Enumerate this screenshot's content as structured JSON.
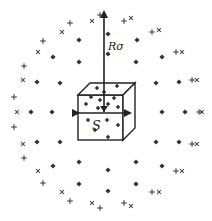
{
  "labels": {
    "radius": "Rσ",
    "side": "S"
  },
  "colors": {
    "ink": "#222222",
    "marker": "#333333",
    "background": "#ffffff"
  },
  "center": [
    106,
    112
  ],
  "cube": {
    "front_x": 78,
    "front_y": 95,
    "size": 45,
    "depth": 12
  },
  "arrow_up": {
    "from": [
      104,
      112
    ],
    "to": [
      104,
      12
    ]
  },
  "arrow_horiz": {
    "from": [
      78,
      113
    ],
    "to": [
      130,
      113
    ]
  },
  "dots": [
    [
      108,
      34
    ],
    [
      79,
      40
    ],
    [
      137,
      40
    ],
    [
      53,
      57
    ],
    [
      108,
      54
    ],
    [
      162,
      57
    ],
    [
      79,
      62
    ],
    [
      136,
      62
    ],
    [
      37,
      82
    ],
    [
      60,
      83
    ],
    [
      156,
      83
    ],
    [
      179,
      82
    ],
    [
      31,
      112
    ],
    [
      52,
      112
    ],
    [
      162,
      112
    ],
    [
      185,
      112
    ],
    [
      37,
      142
    ],
    [
      60,
      142
    ],
    [
      156,
      142
    ],
    [
      179,
      142
    ],
    [
      53,
      166
    ],
    [
      79,
      162
    ],
    [
      108,
      170
    ],
    [
      136,
      162
    ],
    [
      162,
      166
    ],
    [
      79,
      184
    ],
    [
      108,
      191
    ],
    [
      136,
      184
    ]
  ],
  "crosses": [
    [
      100,
      15
    ],
    [
      92,
      21
    ],
    [
      124,
      21
    ],
    [
      131,
      18
    ],
    [
      70,
      23
    ],
    [
      62,
      32
    ],
    [
      152,
      32
    ],
    [
      159,
      30
    ],
    [
      43,
      41
    ],
    [
      38,
      52
    ],
    [
      176,
      52
    ],
    [
      182,
      52
    ],
    [
      24,
      66
    ],
    [
      23,
      80
    ],
    [
      192,
      80
    ],
    [
      197,
      80
    ],
    [
      14,
      97
    ],
    [
      17,
      112
    ],
    [
      199,
      112
    ],
    [
      202,
      112
    ],
    [
      14,
      127
    ],
    [
      23,
      144
    ],
    [
      192,
      144
    ],
    [
      197,
      144
    ],
    [
      24,
      158
    ],
    [
      38,
      171
    ],
    [
      176,
      171
    ],
    [
      182,
      171
    ],
    [
      43,
      183
    ],
    [
      62,
      192
    ],
    [
      152,
      192
    ],
    [
      159,
      192
    ],
    [
      70,
      201
    ],
    [
      92,
      203
    ],
    [
      124,
      203
    ],
    [
      131,
      206
    ],
    [
      100,
      208
    ]
  ],
  "cube_dots": [
    [
      97,
      88
    ],
    [
      117,
      86
    ],
    [
      104,
      92
    ],
    [
      91,
      97
    ],
    [
      100,
      100
    ],
    [
      114,
      98
    ],
    [
      108,
      104
    ],
    [
      86,
      104
    ],
    [
      118,
      107
    ],
    [
      98,
      108
    ],
    [
      88,
      120
    ],
    [
      107,
      120
    ],
    [
      118,
      125
    ],
    [
      95,
      130
    ],
    [
      108,
      137
    ]
  ]
}
